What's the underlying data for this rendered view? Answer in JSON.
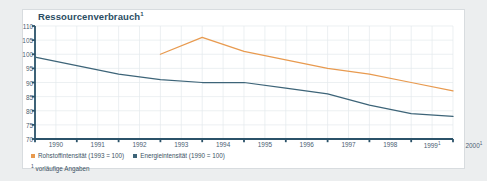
{
  "chart_title": "Ressourcenverbrauch",
  "chart_title_footnote_marker": "1",
  "legend": {
    "items": [
      {
        "label": "Rohstoffintensität (1993 = 100)",
        "color": "#e89a4f",
        "icon": "legend-swatch"
      },
      {
        "label": "Energieintensität (1990 = 100)",
        "color": "#3d6478",
        "icon": "legend-swatch"
      }
    ]
  },
  "footnote": {
    "marker": "1",
    "text": "vorläufige Angaben"
  },
  "colors": {
    "panel_background": "#ffffff",
    "page_background": "#eceeef",
    "panel_border": "#d8dcdf",
    "axis": "#2b5269",
    "grid": "#e4e9ed",
    "title": "#2b4d63",
    "label": "#4a6072",
    "series_rohstoff": "#e89a4f",
    "series_energie": "#3d6478"
  },
  "chart_data": {
    "type": "line",
    "title": "Ressourcenverbrauch",
    "xlabel": "",
    "ylabel": "",
    "ylim": [
      70,
      110
    ],
    "yticks": [
      70,
      75,
      80,
      85,
      90,
      95,
      100,
      105,
      110
    ],
    "grid": true,
    "legend_position": "bottom-left",
    "x": [
      "1990",
      "1991",
      "1992",
      "1993",
      "1994",
      "1995",
      "1996",
      "1997",
      "1998",
      "1999",
      "2000"
    ],
    "xtick_labels": [
      "1990",
      "1991",
      "1992",
      "1993",
      "1994",
      "1995",
      "1996",
      "1997",
      "1998",
      "1999*",
      "2000*"
    ],
    "xlim": [
      1990,
      2000
    ],
    "series": [
      {
        "name": "Rohstoffintensität (1993 = 100)",
        "color": "#e89a4f",
        "x": [
          1993,
          1994,
          1995,
          1996,
          1997,
          1998,
          1999,
          2000
        ],
        "values": [
          100,
          106,
          101,
          98,
          95,
          93,
          90,
          87
        ]
      },
      {
        "name": "Energieintensität (1990 = 100)",
        "color": "#3d6478",
        "x": [
          1990,
          1991,
          1992,
          1993,
          1994,
          1995,
          1996,
          1997,
          1998,
          1999,
          2000
        ],
        "values": [
          99,
          96,
          93,
          91,
          90,
          90,
          88,
          86,
          82,
          79,
          78
        ]
      }
    ],
    "annotations": [
      "vorläufige Angaben"
    ]
  }
}
